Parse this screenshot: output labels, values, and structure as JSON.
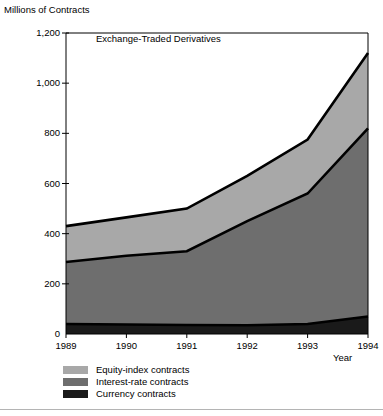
{
  "chart_data": {
    "type": "area",
    "stacked": true,
    "title": "Exchange-Traded Derivatives",
    "xlabel": "Year",
    "ylabel": "Millions of Contracts",
    "x": [
      1989,
      1990,
      1991,
      1992,
      1993,
      1994
    ],
    "xticklabels": [
      "1989",
      "1990",
      "1991",
      "1992",
      "1993",
      "1994"
    ],
    "yticks": [
      0,
      200,
      400,
      600,
      800,
      1000,
      1200
    ],
    "yticklabels": [
      "0",
      "200",
      "400",
      "600",
      "800",
      "1,000",
      "1,200"
    ],
    "ylim": [
      0,
      1200
    ],
    "xlim": [
      1989,
      1994
    ],
    "grid": false,
    "legend_position": "below-left",
    "series": [
      {
        "name": "Currency contracts",
        "color": "#1a1a1a",
        "values": [
          40,
          38,
          36,
          35,
          40,
          70
        ]
      },
      {
        "name": "Interest-rate contracts",
        "color": "#6e6e6e",
        "values": [
          247,
          274,
          294,
          415,
          520,
          750
        ]
      },
      {
        "name": "Equity-index contracts",
        "color": "#a8a8a8",
        "values": [
          143,
          153,
          170,
          180,
          215,
          300
        ]
      }
    ],
    "cumulative_tops": {
      "currency": [
        40,
        38,
        36,
        35,
        40,
        70
      ],
      "interest_rate": [
        287,
        312,
        330,
        450,
        560,
        820
      ],
      "equity_index": [
        430,
        465,
        500,
        630,
        775,
        1120
      ]
    },
    "legend": [
      {
        "label": "Equity-index contracts",
        "color": "#a8a8a8"
      },
      {
        "label": "Interest-rate contracts",
        "color": "#6e6e6e"
      },
      {
        "label": "Currency contracts",
        "color": "#1a1a1a"
      }
    ]
  }
}
